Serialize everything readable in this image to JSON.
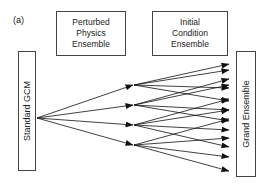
{
  "panel_label": "(a)",
  "nodes": {
    "standard_gcm": "Standard GCM",
    "perturbed_physics": "Perturbed\nPhysics\nEnsemble",
    "initial_condition": "Initial\nCondition\nEnsemble",
    "grand_ensemble": "Grand Ensemble"
  },
  "edges": {
    "gcm_to_perturbed": 4,
    "perturbed_to_grand_per_member": 4,
    "total_grand_members": 16
  },
  "colors": {
    "line": "#111111",
    "box_border": "#444444",
    "background": "#ffffff"
  }
}
